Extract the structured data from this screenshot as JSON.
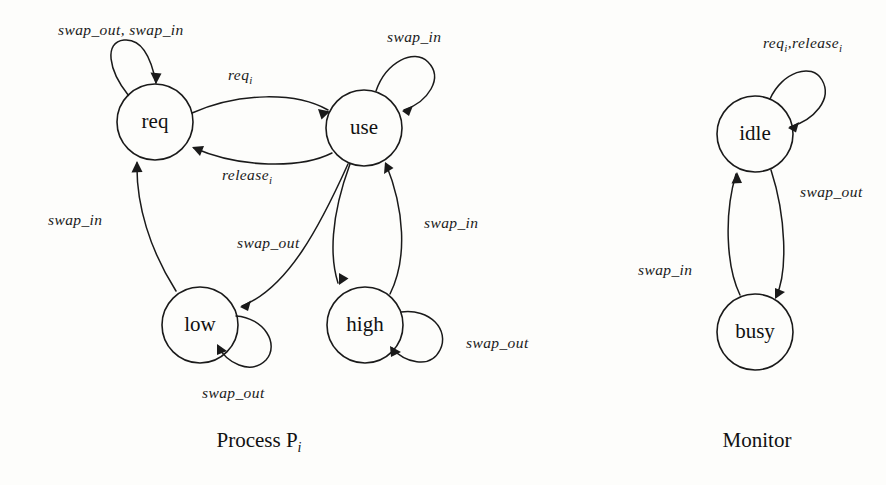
{
  "figure": {
    "background_color": "#fdfdfb",
    "ink_color": "#1a1a1a",
    "type": "state-transition-diagram"
  },
  "process_diagram": {
    "caption_main": "Process P",
    "caption_sub": "i",
    "states": [
      {
        "id": "req",
        "label": "req",
        "cx": 155,
        "cy": 122,
        "r": 38
      },
      {
        "id": "use",
        "label": "use",
        "cx": 364,
        "cy": 128,
        "r": 38
      },
      {
        "id": "low",
        "label": "low",
        "cx": 200,
        "cy": 325,
        "r": 38
      },
      {
        "id": "high",
        "label": "high",
        "cx": 365,
        "cy": 325,
        "r": 38
      }
    ],
    "transitions": [
      {
        "id": "req-self",
        "from": "req",
        "to": "req",
        "label": "swap_out, swap_in",
        "kind": "self-loop"
      },
      {
        "id": "req-to-use",
        "from": "req",
        "to": "use",
        "label": "req",
        "sub": "i",
        "kind": "arc"
      },
      {
        "id": "use-to-req",
        "from": "use",
        "to": "req",
        "label": "release",
        "sub": "i",
        "kind": "arc"
      },
      {
        "id": "use-self",
        "from": "use",
        "to": "use",
        "label": "swap_in",
        "kind": "self-loop"
      },
      {
        "id": "low-to-req",
        "from": "low",
        "to": "req",
        "label": "swap_in",
        "kind": "arc"
      },
      {
        "id": "use-to-low",
        "from": "use",
        "to": "low",
        "label": "swap_out",
        "kind": "arc"
      },
      {
        "id": "use-to-high",
        "from": "use",
        "to": "high",
        "label": "swap_out",
        "kind": "arc"
      },
      {
        "id": "high-to-use",
        "from": "high",
        "to": "use",
        "label": "swap_in",
        "kind": "arc"
      },
      {
        "id": "low-self",
        "from": "low",
        "to": "low",
        "label": "swap_out",
        "kind": "self-loop"
      },
      {
        "id": "high-self",
        "from": "high",
        "to": "high",
        "label": "swap_out",
        "kind": "self-loop"
      }
    ],
    "labels": {
      "req_self": "swap_out, swap_in",
      "req_to_use": "req",
      "req_to_use_sub": "i",
      "use_to_req": "release",
      "use_to_req_sub": "i",
      "use_self": "swap_in",
      "low_to_req": "swap_in",
      "use_to_low": "swap_out",
      "high_to_use": "swap_in",
      "high_self": "swap_out",
      "low_self": "swap_out"
    }
  },
  "monitor_diagram": {
    "caption_main": "Monitor",
    "states": [
      {
        "id": "idle",
        "label": "idle",
        "cx": 755,
        "cy": 134,
        "r": 38
      },
      {
        "id": "busy",
        "label": "busy",
        "cx": 755,
        "cy": 332,
        "r": 38
      }
    ],
    "transitions": [
      {
        "id": "idle-self",
        "from": "idle",
        "to": "idle",
        "label": "req",
        "sub": "i",
        "label2": "release",
        "sub2": "i",
        "kind": "self-loop"
      },
      {
        "id": "idle-to-busy",
        "from": "idle",
        "to": "busy",
        "label": "swap_out",
        "kind": "arc"
      },
      {
        "id": "busy-to-idle",
        "from": "busy",
        "to": "idle",
        "label": "swap_in",
        "kind": "arc"
      }
    ],
    "labels": {
      "idle_self_a": "req",
      "idle_self_a_sub": "i",
      "idle_self_sep": ",",
      "idle_self_b": "release",
      "idle_self_b_sub": "i",
      "idle_to_busy": "swap_out",
      "busy_to_idle": "swap_in"
    }
  }
}
